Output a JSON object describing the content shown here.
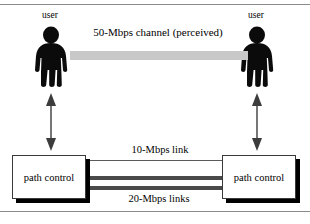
{
  "figure": {
    "title_text": "50-Mbps channel (perceived)",
    "users": {
      "left_label": "user",
      "right_label": "user"
    },
    "channel": {
      "label": "50-Mbps channel (perceived)",
      "bar_color": "#c8c8c8"
    },
    "nodes": [
      {
        "id": "left",
        "label": "path control"
      },
      {
        "id": "right",
        "label": "path control"
      }
    ],
    "links": [
      {
        "label": "10-Mbps link",
        "weight": "thin",
        "count": 1,
        "color": "#5a5a5a"
      },
      {
        "label": "20-Mbps links",
        "weight": "thick",
        "count": 2,
        "color": "#4a4a4a"
      }
    ],
    "icons": {
      "person": "person-silhouette-icon",
      "double_arrow": "double-headed-arrow-icon"
    },
    "colors": {
      "ink": "#000000",
      "rule": "#8a8a8a",
      "box_border": "#3a3a3a",
      "shadow": "#000000",
      "channel_gray": "#c8c8c8"
    }
  }
}
